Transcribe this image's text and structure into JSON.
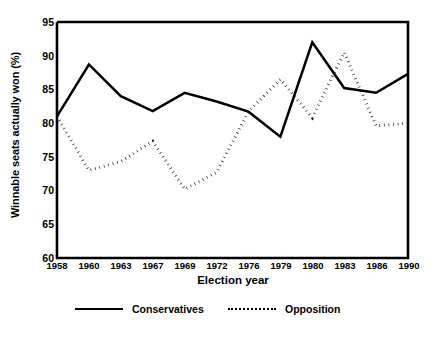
{
  "chart_data": {
    "type": "line",
    "title": "",
    "xlabel": "Election year",
    "ylabel": "Winnable seats actually won (%)",
    "categories": [
      "1958",
      "1960",
      "1963",
      "1967",
      "1969",
      "1972",
      "1976",
      "1979",
      "1980",
      "1983",
      "1986",
      "1990"
    ],
    "xticklabels": [
      "1958",
      "1960",
      "1963",
      "1967",
      "1969",
      "1972",
      "1976",
      "1979",
      "1980",
      "1983",
      "1986",
      "1990"
    ],
    "yticklabels": [
      "60",
      "65",
      "70",
      "75",
      "80",
      "85",
      "90",
      "95"
    ],
    "ylim": [
      60,
      95
    ],
    "ytick_step": 5,
    "grid": false,
    "legend_position": "bottom",
    "series": [
      {
        "name": "Conservatives",
        "style": "solid",
        "color": "#000000",
        "values": [
          81.0,
          88.7,
          84.0,
          81.8,
          84.5,
          83.2,
          81.7,
          78.0,
          92.0,
          85.2,
          84.5,
          87.3
        ]
      },
      {
        "name": "Opposition",
        "style": "dotted",
        "color": "#000000",
        "values": [
          81.0,
          73.0,
          74.3,
          77.3,
          70.2,
          72.7,
          81.7,
          86.5,
          80.8,
          90.5,
          79.6,
          80.0
        ]
      }
    ]
  },
  "axes": {
    "y_label": "Winnable seats actually won (%)",
    "x_label": "Election year",
    "y_ticks": [
      "95",
      "90",
      "85",
      "80",
      "75",
      "70",
      "65",
      "60"
    ],
    "x_ticks": [
      "1958",
      "1960",
      "1963",
      "1967",
      "1969",
      "1972",
      "1976",
      "1979",
      "1980",
      "1983",
      "1986",
      "1990"
    ]
  },
  "legend": {
    "items": [
      {
        "label": "Conservatives",
        "style": "solid"
      },
      {
        "label": "Opposition",
        "style": "dotted"
      }
    ]
  }
}
